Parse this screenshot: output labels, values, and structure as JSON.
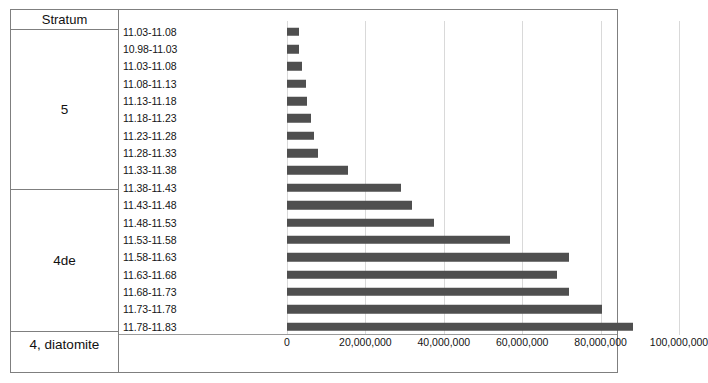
{
  "table": {
    "header_label": "Stratum",
    "strata": [
      {
        "name": "stratum-5",
        "label": "5"
      },
      {
        "name": "stratum-4de",
        "label": "4de"
      },
      {
        "name": "stratum-4-diatomite",
        "label": "4, diatomite"
      }
    ]
  },
  "chart_data": {
    "type": "bar",
    "orientation": "horizontal",
    "title": "",
    "xlabel": "",
    "ylabel": "",
    "xlim": [
      0,
      100000000
    ],
    "grid": true,
    "legend": false,
    "bar_color": "#4f4f4f",
    "gridline_color": "#d9d9d9",
    "xticks": [
      0,
      20000000,
      40000000,
      60000000,
      80000000,
      100000000
    ],
    "xtick_labels": [
      "0",
      "20,000,000",
      "40,000,000",
      "60,000,000",
      "80,000,000",
      "100,000,000"
    ],
    "categories": [
      "11.03-11.08",
      "10.98-11.03",
      "11.03-11.08",
      "11.08-11.13",
      "11.13-11.18",
      "11.18-11.23",
      "11.23-11.28",
      "11.28-11.33",
      "11.33-11.38",
      "11.38-11.43",
      "11.43-11.48",
      "11.48-11.53",
      "11.53-11.58",
      "11.58-11.63",
      "11.63-11.68",
      "11.68-11.73",
      "11.73-11.78",
      "11.78-11.83"
    ],
    "values": [
      3000000,
      3000000,
      3800000,
      4900000,
      5000000,
      6100000,
      6900000,
      7800000,
      15600000,
      29000000,
      32000000,
      37500000,
      57000000,
      72000000,
      69000000,
      72000000,
      80400000,
      88300000
    ],
    "category_strata": [
      "5",
      "5",
      "5",
      "5",
      "5",
      "5",
      "5",
      "5",
      "5",
      "4de",
      "4de",
      "4de",
      "4de",
      "4de",
      "4de",
      "4de",
      "4de",
      "4, diatomite"
    ]
  }
}
